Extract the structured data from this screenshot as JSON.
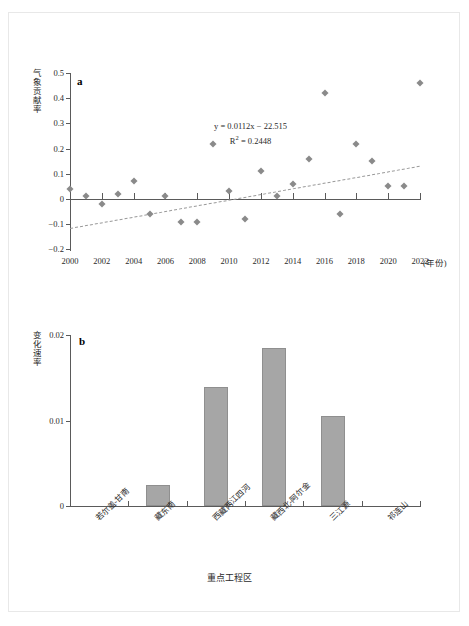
{
  "figure": {
    "panel_a_letter": "a",
    "panel_b_letter": "b"
  },
  "chart_data": [
    {
      "type": "scatter",
      "panel": "a",
      "title": "",
      "xlabel": "(年份)",
      "ylabel": "气象贡献率",
      "xlim": [
        2000,
        2022
      ],
      "ylim": [
        -0.2,
        0.5
      ],
      "yticks": [
        "0.5",
        "0.4",
        "0.3",
        "0.2",
        "0.1",
        "0",
        "-0.1",
        "-0.2"
      ],
      "xticks": [
        "2000",
        "2002",
        "2004",
        "2006",
        "2008",
        "2010",
        "2012",
        "2014",
        "2016",
        "2018",
        "2020",
        "2022"
      ],
      "grid": false,
      "legend": null,
      "x": [
        2000,
        2001,
        2002,
        2003,
        2004,
        2005,
        2006,
        2007,
        2008,
        2009,
        2010,
        2011,
        2012,
        2013,
        2014,
        2015,
        2016,
        2017,
        2018,
        2019,
        2020,
        2021,
        2022
      ],
      "values": [
        0.04,
        0.01,
        -0.02,
        0.02,
        0.07,
        -0.06,
        0.01,
        -0.09,
        -0.09,
        0.22,
        0.03,
        -0.08,
        0.11,
        0.01,
        0.06,
        0.16,
        0.42,
        -0.06,
        0.22,
        0.15,
        0.05,
        0.05,
        0.46
      ],
      "annotations": {
        "equation": "y = 0.0112x − 22.515",
        "r_squared_label": "R",
        "r_squared_sup": "2",
        "r_squared_value": " = 0.2448"
      },
      "trendline": {
        "slope": 0.0112,
        "intercept": -22.515,
        "style": "dashed",
        "y_at_x_start": -0.115,
        "y_at_x_end": 0.132
      },
      "marker_color": "#8a8a8a",
      "marker_shape": "diamond"
    },
    {
      "type": "bar",
      "panel": "b",
      "title": "",
      "xlabel": "重点工程区",
      "ylabel": "变化速率",
      "ylim": [
        0,
        0.02
      ],
      "yticks": [
        "0.02",
        "0.01",
        "0"
      ],
      "grid": false,
      "legend": null,
      "categories": [
        "若尔盖-甘南",
        "藏东南",
        "西藏两江四河",
        "藏西北-阿尔金",
        "三江源",
        "祁连山"
      ],
      "values": [
        0,
        0.0025,
        0.0139,
        0.0185,
        0.0105,
        0
      ],
      "bar_color": "#a6a6a6"
    }
  ]
}
